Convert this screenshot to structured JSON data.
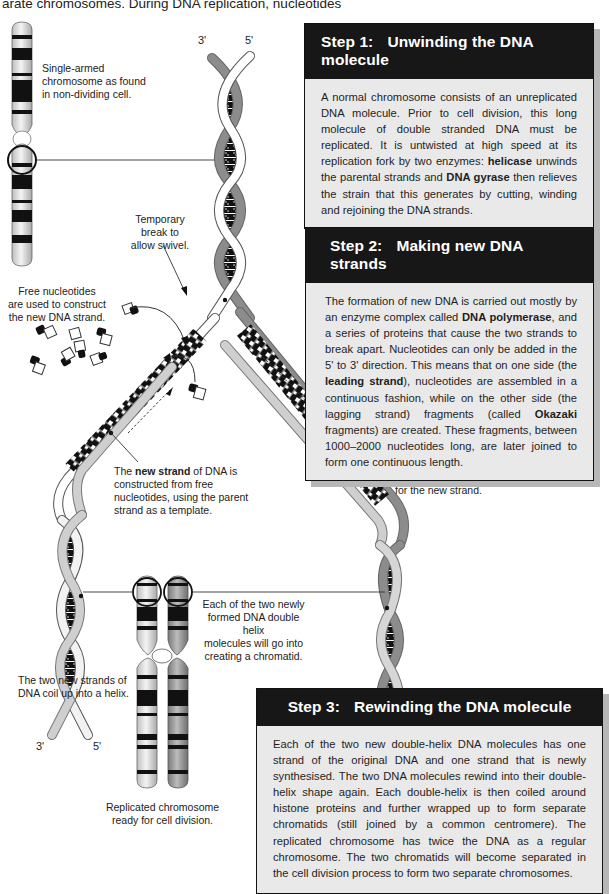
{
  "intro": {
    "line_left": "arate chromosomes. During DNA replication, nucleotides",
    "line_right": "by base pairing"
  },
  "labels": {
    "prime_top_3": "3'",
    "prime_top_5": "5'",
    "single_chromosome": "Single-armed chromosome as found in non-dividing cell.",
    "single_chromosome_lines": [
      "Single-armed",
      "chromosome as found",
      "in non-dividing cell."
    ],
    "temporary_break_lines": [
      "Temporary",
      "break to",
      "allow swivel."
    ],
    "free_nucleotides_lines": [
      "Free nucleotides",
      "are used to construct",
      "the new DNA strand."
    ],
    "new_strand": {
      "pre": "The ",
      "bold": "new strand",
      "post_lines": [
        " of DNA is",
        "constructed from free",
        "nucleotides, using the parent",
        "strand as a template."
      ]
    },
    "parent_strand_lines": [
      "Parent strand of DNA",
      "is used as a template",
      "to match nucleotides",
      "for the new strand."
    ],
    "chromatid_lines": [
      "Each of the two newly",
      "formed DNA double helix",
      "molecules will go into",
      "creating a chromatid."
    ],
    "coil_lines": [
      "The two new strands of",
      "DNA coil up into a helix."
    ],
    "replicated_lines": [
      "Replicated chromosome",
      "ready for cell division."
    ],
    "prime_bl_3": "3'",
    "prime_bl_5": "5'",
    "prime_br_3": "3'",
    "prime_br_5": "5'"
  },
  "steps": [
    {
      "number": "Step 1:",
      "title": "Unwinding the DNA molecule",
      "body_parts": [
        {
          "t": "A normal chromosome consists of an unreplicated DNA molecule. Prior to cell division, this long molecule of double stranded DNA must be replicated. It is untwisted at high speed at its replication fork by two enzymes: "
        },
        {
          "b": "helicase"
        },
        {
          "t": " unwinds the parental strands and "
        },
        {
          "b": "DNA gyrase"
        },
        {
          "t": " then relieves the strain that this generates by cutting, winding and rejoining the DNA strands."
        }
      ]
    },
    {
      "number": "Step 2:",
      "title": "Making new DNA strands",
      "body_parts": [
        {
          "t": "The formation of new DNA is carried out mostly by an enzyme complex called "
        },
        {
          "b": "DNA polymerase"
        },
        {
          "t": ", and a series of proteins that cause the two strands to break apart. Nucleotides can only be added in the 5' to 3' direction. This means that on one side (the "
        },
        {
          "b": "leading strand"
        },
        {
          "t": "), nucleotides are assembled in a continuous fashion, while on the other side (the lagging strand) fragments (called "
        },
        {
          "b": "Okazaki"
        },
        {
          "t": " fragments) are created. These fragments, between 1000–2000 nucleotides long, are later joined to form one continuous length."
        }
      ]
    },
    {
      "number": "Step 3:",
      "title": "Rewinding the DNA molecule",
      "body_parts": [
        {
          "t": "Each of the two new double-helix DNA molecules has one strand of the original DNA and one strand that is newly synthesised. The two DNA molecules rewind into their double-helix shape again. Each double-helix is then coiled around histone proteins and further wrapped up to form separate chromatids (still joined by a common centromere). The replicated chromosome has twice the DNA as a regular chromosome. The two chromatids will become separated in the cell division process to form two separate chromosomes."
        }
      ]
    }
  ],
  "colors": {
    "header_bg": "#171717",
    "box_bg": "#e9e9e9",
    "shadow": "#b7b7b7",
    "parent_strand_dark": "#8c8c8c",
    "parent_strand_light": "#ffffff",
    "new_strand": "#c8c8c8",
    "base_black": "#111111"
  }
}
